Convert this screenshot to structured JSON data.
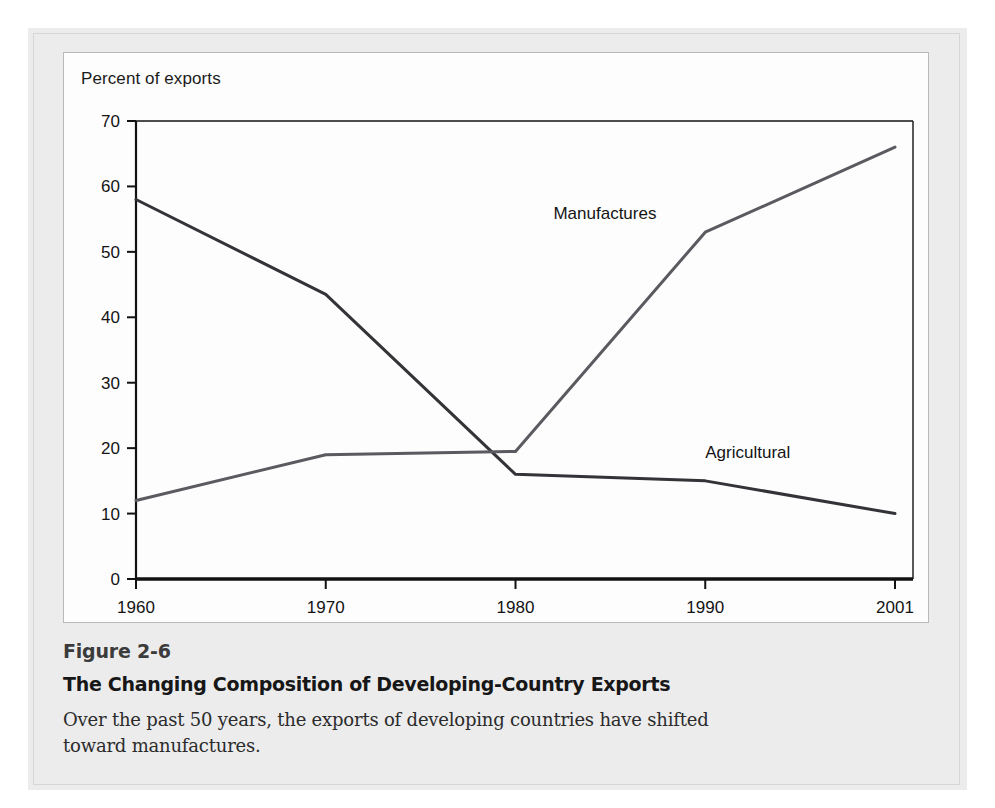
{
  "figure": {
    "number_label": "Figure 2-6",
    "title": "The Changing Composition of Developing-Country Exports",
    "caption": "Over the past 50 years, the exports of developing countries have shifted toward manufactures."
  },
  "colors": {
    "panel_background": "#ececed",
    "card_background": "#fdfdfd",
    "card_border": "#b9b9bb",
    "axis": "#121212",
    "series_manufactures": "#5a5a60",
    "series_agricultural": "#333338",
    "text": "#141414"
  },
  "chart_data": {
    "type": "line",
    "title": "",
    "xlabel": "",
    "ylabel": "Percent of exports",
    "x": [
      1960,
      1970,
      1980,
      1990,
      2001
    ],
    "xtick_labels": [
      "1960",
      "1970",
      "1980",
      "1990",
      "2001"
    ],
    "ytick_labels": [
      "0",
      "10",
      "20",
      "30",
      "40",
      "50",
      "60",
      "70"
    ],
    "yticks": [
      0,
      10,
      20,
      30,
      40,
      50,
      60,
      70
    ],
    "ylim": [
      0,
      70
    ],
    "grid": false,
    "legend_position": "inline-annotations",
    "series": [
      {
        "name": "Agricultural",
        "values": [
          58,
          43.5,
          16,
          15,
          10
        ],
        "label_text": "Agricultural",
        "label_x": 1990,
        "label_y": 18.5
      },
      {
        "name": "Manufactures",
        "values": [
          12,
          19,
          19.5,
          53,
          66
        ],
        "label_text": "Manufactures",
        "label_x": 1982,
        "label_y": 55
      }
    ]
  }
}
